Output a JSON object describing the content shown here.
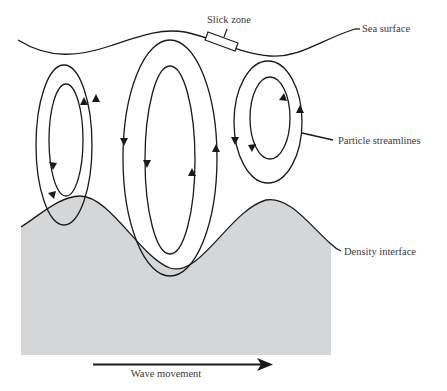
{
  "diagram": {
    "labels": {
      "slick_zone": "Slick zone",
      "sea_surface": "Sea surface",
      "particle_streamlines": "Particle streamlines",
      "density_interface": "Density interface",
      "wave_movement": "Wave movement"
    },
    "colors": {
      "line": "#1a1a1a",
      "lower_layer_fill": "#d4d6d8",
      "text": "#3a3a3a",
      "background": "#ffffff"
    },
    "elements": [
      {
        "id": "sea-surface",
        "type": "curve",
        "description": "wavy sea surface line"
      },
      {
        "id": "slick-zone",
        "type": "rectangle",
        "description": "slick marker on sea surface above converging flow"
      },
      {
        "id": "left-cell",
        "type": "streamline-loops",
        "count": 2,
        "rotation": "clockwise"
      },
      {
        "id": "center-cell",
        "type": "streamline-loops",
        "count": 2,
        "rotation": "counter-clockwise"
      },
      {
        "id": "right-cell",
        "type": "streamline-loops",
        "count": 2,
        "rotation": "clockwise"
      },
      {
        "id": "density-interface",
        "type": "curve",
        "description": "wavy interface with shaded lower layer"
      },
      {
        "id": "wave-direction-arrow",
        "type": "arrow",
        "direction": "right"
      }
    ]
  }
}
